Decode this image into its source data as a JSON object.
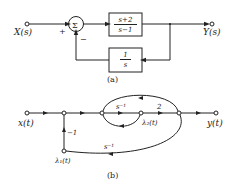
{
  "diagram_a": {
    "caption": "(a)",
    "input_label": "X(s)",
    "output_label": "Y(s)",
    "summer_symbol": "Σ",
    "summer_plus": "+",
    "summer_minus": "−",
    "forward_block": {
      "numerator": "s+2",
      "denominator": "s−1"
    },
    "feedback_block": {
      "numerator": "1",
      "denominator": "s"
    }
  },
  "diagram_b": {
    "caption": "(b)",
    "input_label": "x(t)",
    "output_label": "y(t)",
    "node_lambda1": "λ₁(t)",
    "node_lambda2": "λ₂(t)",
    "branch_gain_minus1": "−1",
    "branch_gain_s_inv_top": "s⁻¹",
    "branch_gain_2": "2",
    "branch_gain_s_inv_bottom": "s⁻¹"
  }
}
